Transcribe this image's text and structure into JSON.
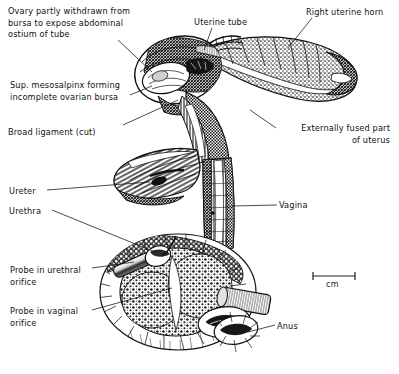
{
  "figure": {
    "background_color": "#ffffff",
    "ink_color": "#111111",
    "width": 399,
    "height": 374
  },
  "labels": [
    {
      "id": "ovary",
      "name": "ovary-label",
      "lines": [
        "Ovary partly withdrawn from",
        "bursa to expose abdominal",
        "ostium of tube"
      ],
      "text": "Ovary partly withdrawn from\nbursa to expose abdominal\nostium of tube",
      "x": 8,
      "y": 6,
      "align": "left"
    },
    {
      "id": "mesosalpinx",
      "name": "sup-mesosalpinx-label",
      "lines": [
        "Sup. mesosalpinx forming",
        "incomplete ovarian bursa"
      ],
      "text": "Sup. mesosalpinx forming\nincomplete ovarian bursa",
      "x": 10,
      "y": 80,
      "align": "left"
    },
    {
      "id": "broad-ligament",
      "name": "broad-ligament-label",
      "lines": [
        "Broad ligament (cut)"
      ],
      "text": "Broad ligament (cut)",
      "x": 8,
      "y": 127,
      "align": "left"
    },
    {
      "id": "ureter",
      "name": "ureter-label",
      "lines": [
        "Ureter"
      ],
      "text": "Ureter",
      "x": 9,
      "y": 186,
      "align": "left"
    },
    {
      "id": "urethra",
      "name": "urethra-label",
      "lines": [
        "Urethra"
      ],
      "text": "Urethra",
      "x": 9,
      "y": 206,
      "align": "left"
    },
    {
      "id": "probe-urethral",
      "name": "probe-urethral-orifice-label",
      "lines": [
        "Probe in urethral",
        "orifice"
      ],
      "text": "Probe in urethral\norifice",
      "x": 10,
      "y": 265,
      "align": "left"
    },
    {
      "id": "probe-vaginal",
      "name": "probe-vaginal-orifice-label",
      "lines": [
        "Probe in vaginal",
        "orifice"
      ],
      "text": "Probe in vaginal\norifice",
      "x": 10,
      "y": 306,
      "align": "left"
    },
    {
      "id": "uterine-tube",
      "name": "uterine-tube-label",
      "lines": [
        "Uterine tube"
      ],
      "text": "Uterine tube",
      "x": 194,
      "y": 17,
      "align": "left"
    },
    {
      "id": "right-uterine-horn",
      "name": "right-uterine-horn-label",
      "lines": [
        "Right uterine horn"
      ],
      "text": "Right uterine horn",
      "x": 306,
      "y": 7,
      "align": "left"
    },
    {
      "id": "externally-fused",
      "name": "externally-fused-uterus-label",
      "lines": [
        "Externally fused part",
        "of uterus"
      ],
      "text": "Externally fused part\nof uterus",
      "x": 278,
      "y": 123,
      "align": "right"
    },
    {
      "id": "vagina",
      "name": "vagina-label",
      "lines": [
        "Vagina"
      ],
      "text": "Vagina",
      "x": 279,
      "y": 200,
      "align": "left"
    },
    {
      "id": "anus",
      "name": "anus-label",
      "lines": [
        "Anus"
      ],
      "text": "Anus",
      "x": 277,
      "y": 321,
      "align": "left"
    }
  ],
  "scale_bar": {
    "name": "scale-bar",
    "caption": "cm",
    "x1": 313,
    "x2": 355,
    "y": 276,
    "caption_x": 326,
    "caption_y": 282
  }
}
